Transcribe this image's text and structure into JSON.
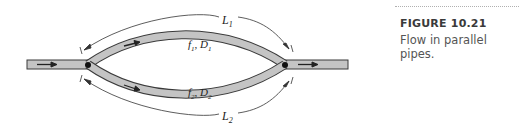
{
  "figure": {
    "number_label": "FIGURE 10.21",
    "caption": "Flow in parallel pipes.",
    "labels": {
      "L1": "L",
      "L1_sub": "1",
      "L2": "L",
      "L2_sub": "2",
      "pipe1_f": "f",
      "pipe1_f_sub": "1",
      "pipe1_D": "D",
      "pipe1_D_sub": "1",
      "pipe2_f": "f",
      "pipe2_f_sub": "2",
      "pipe2_D": "D",
      "pipe2_D_sub": "2",
      "comma": ", "
    },
    "colors": {
      "pipe_fill": "#c4c4c4",
      "pipe_outline": "#3a3a3a",
      "arrow": "#222222",
      "caption_text": "#555555"
    }
  }
}
